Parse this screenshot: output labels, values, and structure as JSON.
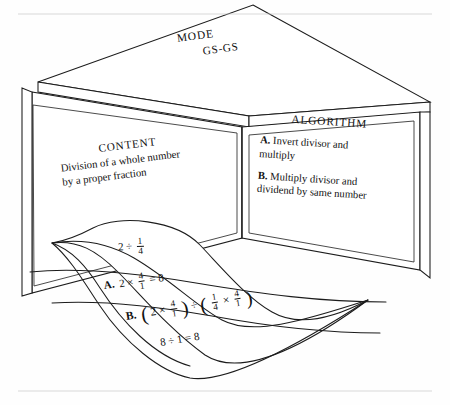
{
  "figure": {
    "type": "three-dimensional-box-diagram",
    "ink_color": "#1c1c1c",
    "paper_color": "#ffffff"
  },
  "top_face": {
    "title": "MODE",
    "subtitle": "GS-GS"
  },
  "left_wall": {
    "title": "CONTENT",
    "line1": "Division of a whole number",
    "line2": "by a proper fraction"
  },
  "right_wall": {
    "title": "ALGORITHM",
    "items": [
      {
        "label": "A.",
        "line1": "Invert divisor and",
        "line2": "multiply"
      },
      {
        "label": "B.",
        "line1": "Multiply divisor and",
        "line2": "dividend by same number"
      }
    ]
  },
  "banner": {
    "rows": [
      {
        "label": "",
        "expression": "2 ÷ 1/4",
        "parts": {
          "lead": "2",
          "op": "÷",
          "num": "1",
          "den": "4"
        }
      },
      {
        "label": "A.",
        "expression": "2 × 4/1 = 8",
        "parts": {
          "lead": "2",
          "op": "×",
          "num": "4",
          "den": "1",
          "tail": "= 8"
        }
      },
      {
        "label": "B.",
        "expression": "(2 × 4/1) ÷ (1/4 × 4/1)",
        "parts": {
          "open1": "(",
          "a_lead": "2",
          "a_op": "×",
          "a_num": "4",
          "a_den": "1",
          "close1": ")",
          "mid_op": "÷",
          "open2": "(",
          "b_num": "1",
          "b_den": "4",
          "b_op": "×",
          "c_num": "4",
          "c_den": "1",
          "close2": ")"
        }
      },
      {
        "label": "",
        "expression": "8 ÷ 1 = 8",
        "parts": {
          "lead": "8",
          "op": "÷",
          "rhs": "1",
          "tail": "= 8"
        }
      }
    ]
  }
}
